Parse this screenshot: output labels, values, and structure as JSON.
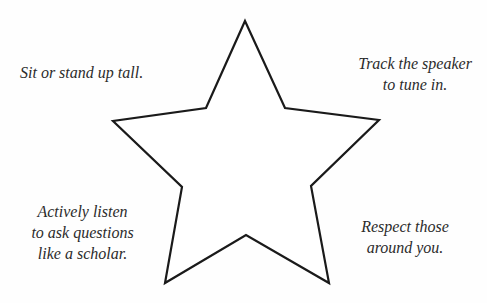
{
  "worksheet": {
    "center_shape": "star-outline",
    "stroke_color": "#1a1a1a",
    "notes": {
      "top_left": [
        "Sit or stand up tall."
      ],
      "top_right": [
        "Track the speaker",
        "to tune in."
      ],
      "bottom_left": [
        "Actively listen",
        "to ask questions",
        "like a scholar."
      ],
      "bottom_right": [
        "Respect those",
        "around you."
      ]
    }
  }
}
